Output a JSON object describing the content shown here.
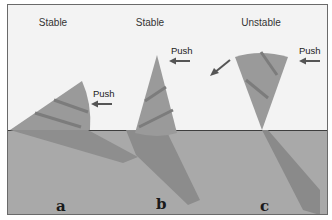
{
  "figure": {
    "panels": [
      {
        "id": "a",
        "heading": "Stable",
        "push_label": "Push",
        "caption": "a",
        "state": "cone lying on its side"
      },
      {
        "id": "b",
        "heading": "Stable",
        "push_label": "Push",
        "caption": "b",
        "state": "cone standing on its base"
      },
      {
        "id": "c",
        "heading": "Unstable",
        "push_label": "Push",
        "caption": "c",
        "state": "cone balanced on its tip"
      }
    ],
    "colors": {
      "background": "#f3f3f3",
      "ground": "#a9a9a9",
      "ground_line": "#3e3e3e",
      "cone": "#9a9a9a",
      "cone_stripe": "#7c7c7c",
      "shadow": "#8c8c8c",
      "arrow": "#555555"
    }
  }
}
